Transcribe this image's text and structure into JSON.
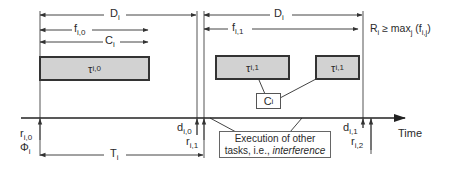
{
  "diagram": {
    "labels": {
      "D": "D",
      "D_sub": "i",
      "f0": "f",
      "f0_sub": "i,0",
      "f1": "f",
      "f1_sub": "i,1",
      "C": "C",
      "C_sub": "i",
      "T": "T",
      "T_sub": "i",
      "r0": "r",
      "r0_sub": "i,0",
      "phi": "Φ",
      "phi_sub": "i",
      "d0": "d",
      "d0_sub": "i,0",
      "r1": "r",
      "r1_sub": "i,1",
      "d1": "d",
      "d1_sub": "i,1",
      "r2": "r",
      "r2_sub": "i,2",
      "time_axis": "Time"
    },
    "tasks": [
      {
        "name": "τ",
        "sub": "i,0"
      },
      {
        "name": "τ",
        "sub": "i,1"
      },
      {
        "name": "τ",
        "sub": "i,1"
      }
    ],
    "c_box": {
      "name": "C",
      "sub": "i"
    },
    "interference_note": {
      "line1": "Execution of other",
      "line2_prefix": "tasks, i.e., ",
      "line2_italic": "interference"
    },
    "formula": {
      "R": "R",
      "R_sub": "i",
      "op": " ≥ max",
      "max_sub": "j",
      "arg_open": " (f",
      "arg_sub": "i,j",
      "arg_close": ")"
    },
    "colors": {
      "task_fill": "#d2d2d2",
      "stroke": "#333333"
    }
  }
}
